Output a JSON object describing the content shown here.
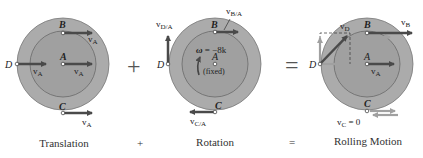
{
  "colors": {
    "outer_disk": "#a8a8a8",
    "inner_disk": "#9c9c9c",
    "disk_edge": "#6a6a6a",
    "arrow_dark": "#4a4a4a",
    "arrow_light": "#9a9a9a",
    "text": "#222222"
  },
  "panels": [
    {
      "name": "translation",
      "caption": "Translation",
      "points": {
        "A": "A",
        "B": "B",
        "C": "C",
        "D": "D"
      },
      "vectors": {
        "vB": "v",
        "vB_sub": "A",
        "vA": "v",
        "vA_sub": "A",
        "vD": "v",
        "vD_sub": "A",
        "vC": "v",
        "vC_sub": "A"
      }
    },
    {
      "name": "rotation",
      "caption": "Rotation",
      "points": {
        "A": "A",
        "B": "B",
        "C": "C",
        "D": "D"
      },
      "omega_symbol": "ω",
      "omega_value": " = −8k",
      "fixed_note": "(fixed)",
      "vectors": {
        "vB": "v",
        "vB_sub": "B/A",
        "vD": "v",
        "vD_sub": "D/A",
        "vC": "v",
        "vC_sub": "C/A"
      }
    },
    {
      "name": "rolling-motion",
      "caption": "Rolling Motion",
      "points": {
        "A": "A",
        "B": "B",
        "C": "C",
        "D": "D"
      },
      "vectors": {
        "vB": "v",
        "vB_sub": "B",
        "vA": "v",
        "vA_sub": "A",
        "vD": "v",
        "vD_sub": "D",
        "vC": "v",
        "vC_sub": "C",
        "vC_eq": " = 0"
      }
    }
  ],
  "operators": {
    "plus": "+",
    "equals": "=",
    "plus_small": "+",
    "equals_small": "="
  }
}
